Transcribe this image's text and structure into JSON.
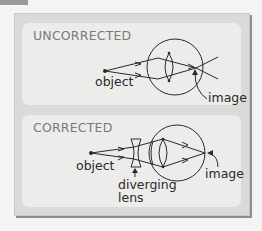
{
  "panels": [
    {
      "title": "UNCORRECTED",
      "labels": {
        "object": "object",
        "image": "image"
      }
    },
    {
      "title": "CORRECTED",
      "labels": {
        "object": "object",
        "image": "image",
        "lens_line1": "diverging",
        "lens_line2": "lens"
      }
    }
  ],
  "colors": {
    "background": "#f4f4f2",
    "card": "#dadad8",
    "panel": "#ececea",
    "title": "#7a7a7a",
    "ink": "#2a2a2a"
  }
}
